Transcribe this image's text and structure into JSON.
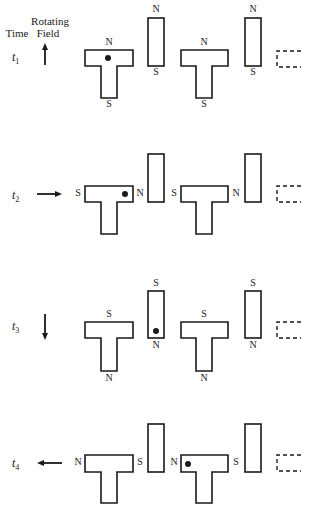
{
  "header": {
    "time_label": "Time",
    "field_label_line1": "Rotating",
    "field_label_line2": "Field"
  },
  "colors": {
    "ink": "#1a1a1a",
    "background": "#ffffff"
  },
  "rows": [
    {
      "time": "t",
      "sub": "1",
      "ty": 57,
      "arrow": {
        "dir": "up",
        "x1": 45,
        "y1": 65,
        "x2": 45,
        "y2": 43
      },
      "rotors": [
        {
          "x": 85,
          "top": 50,
          "cbBottom": 66,
          "stemL": 101,
          "stemR": 117,
          "right": 133,
          "bottom": 98,
          "poles": [
            {
              "t": "N",
              "x": 109,
              "y": 43
            },
            {
              "t": "S",
              "x": 109,
              "y": 105
            }
          ],
          "dot": {
            "x": 108,
            "y": 58
          }
        },
        {
          "x": 181,
          "top": 50,
          "cbBottom": 66,
          "stemL": 196,
          "stemR": 212,
          "right": 228,
          "bottom": 98,
          "poles": [
            {
              "t": "N",
              "x": 204,
              "y": 43
            },
            {
              "t": "S",
              "x": 204,
              "y": 105
            }
          ],
          "dot": null
        }
      ],
      "bars": [
        {
          "x": 148,
          "y": 18,
          "w": 16,
          "h": 48,
          "poles": [
            {
              "t": "N",
              "x": 156,
              "y": 10
            },
            {
              "t": "S",
              "x": 156,
              "y": 73
            }
          ],
          "dot": null
        },
        {
          "x": 245,
          "y": 18,
          "w": 16,
          "h": 48,
          "poles": [
            {
              "t": "N",
              "x": 253,
              "y": 10
            },
            {
              "t": "S",
              "x": 253,
              "y": 73
            }
          ],
          "dot": null
        }
      ],
      "dashed": {
        "x": 277,
        "y": 51,
        "w": 24,
        "h": 16
      }
    },
    {
      "time": "t",
      "sub": "2",
      "ty": 195,
      "arrow": {
        "dir": "right",
        "x1": 37,
        "y1": 194,
        "x2": 62,
        "y2": 194
      },
      "rotors": [
        {
          "x": 85,
          "top": 186,
          "cbBottom": 202,
          "stemL": 101,
          "stemR": 117,
          "right": 133,
          "bottom": 234,
          "poles": [
            {
              "t": "S",
              "x": 78,
              "y": 194
            },
            {
              "t": "N",
              "x": 140,
              "y": 194
            }
          ],
          "dot": {
            "x": 125,
            "y": 194
          }
        },
        {
          "x": 181,
          "top": 186,
          "cbBottom": 202,
          "stemL": 196,
          "stemR": 212,
          "right": 228,
          "bottom": 234,
          "poles": [
            {
              "t": "S",
              "x": 174,
              "y": 194
            },
            {
              "t": "N",
              "x": 236,
              "y": 194
            }
          ],
          "dot": null
        }
      ],
      "bars": [
        {
          "x": 148,
          "y": 154,
          "w": 16,
          "h": 48,
          "poles": [],
          "dot": null
        },
        {
          "x": 245,
          "y": 154,
          "w": 16,
          "h": 48,
          "poles": [],
          "dot": null
        }
      ],
      "dashed": {
        "x": 277,
        "y": 186,
        "w": 24,
        "h": 16
      }
    },
    {
      "time": "t",
      "sub": "3",
      "ty": 326,
      "arrow": {
        "dir": "down",
        "x1": 45,
        "y1": 314,
        "x2": 45,
        "y2": 340
      },
      "rotors": [
        {
          "x": 85,
          "top": 322,
          "cbBottom": 338,
          "stemL": 101,
          "stemR": 117,
          "right": 133,
          "bottom": 371,
          "poles": [
            {
              "t": "S",
              "x": 109,
              "y": 315
            },
            {
              "t": "N",
              "x": 109,
              "y": 379
            }
          ],
          "dot": null
        },
        {
          "x": 181,
          "top": 322,
          "cbBottom": 338,
          "stemL": 196,
          "stemR": 212,
          "right": 228,
          "bottom": 371,
          "poles": [
            {
              "t": "S",
              "x": 204,
              "y": 315
            },
            {
              "t": "N",
              "x": 204,
              "y": 379
            }
          ],
          "dot": null
        }
      ],
      "bars": [
        {
          "x": 148,
          "y": 291,
          "w": 16,
          "h": 47,
          "poles": [
            {
              "t": "S",
              "x": 156,
              "y": 284
            },
            {
              "t": "N",
              "x": 156,
              "y": 346
            }
          ],
          "dot": {
            "x": 156,
            "y": 331
          }
        },
        {
          "x": 245,
          "y": 291,
          "w": 16,
          "h": 47,
          "poles": [
            {
              "t": "S",
              "x": 253,
              "y": 284
            },
            {
              "t": "N",
              "x": 253,
              "y": 346
            }
          ],
          "dot": null
        }
      ],
      "dashed": {
        "x": 277,
        "y": 322,
        "w": 24,
        "h": 16
      }
    },
    {
      "time": "t",
      "sub": "4",
      "ty": 463,
      "arrow": {
        "dir": "left",
        "x1": 62,
        "y1": 463,
        "x2": 37,
        "y2": 463
      },
      "rotors": [
        {
          "x": 85,
          "top": 455,
          "cbBottom": 472,
          "stemL": 101,
          "stemR": 117,
          "right": 133,
          "bottom": 503,
          "poles": [
            {
              "t": "N",
              "x": 78,
              "y": 463
            },
            {
              "t": "S",
              "x": 140,
              "y": 463
            }
          ],
          "dot": null
        },
        {
          "x": 181,
          "top": 455,
          "cbBottom": 472,
          "stemL": 196,
          "stemR": 212,
          "right": 228,
          "bottom": 503,
          "poles": [
            {
              "t": "N",
              "x": 174,
              "y": 463
            },
            {
              "t": "S",
              "x": 236,
              "y": 463
            }
          ],
          "dot": {
            "x": 188,
            "y": 464
          }
        }
      ],
      "bars": [
        {
          "x": 148,
          "y": 424,
          "w": 16,
          "h": 48,
          "poles": [],
          "dot": null
        },
        {
          "x": 245,
          "y": 424,
          "w": 16,
          "h": 48,
          "poles": [],
          "dot": null
        }
      ],
      "dashed": {
        "x": 277,
        "y": 455,
        "w": 24,
        "h": 16
      }
    }
  ]
}
